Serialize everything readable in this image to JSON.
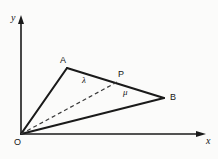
{
  "figure": {
    "background": "#fbfbfa",
    "stroke_color": "#1a1a1a",
    "dashed_color": "#3a3a3a"
  },
  "axes": {
    "x_label": "x",
    "y_label": "y",
    "origin_label": "O",
    "origin": {
      "x": 21,
      "y": 134
    },
    "x_axis_end": {
      "x": 205,
      "y": 134
    },
    "y_axis_end": {
      "x": 21,
      "y": 17
    }
  },
  "points": [
    {
      "name": "A",
      "label": "A",
      "x": 67,
      "y": 68,
      "label_x": 60,
      "label_y": 56
    },
    {
      "name": "B",
      "label": "B",
      "x": 164,
      "y": 98,
      "label_x": 170,
      "label_y": 93
    },
    {
      "name": "P",
      "label": "P",
      "x": 119,
      "y": 81,
      "label_x": 118,
      "label_y": 70
    },
    {
      "name": "O",
      "label": "O",
      "x": 21,
      "y": 134,
      "label_x": 14,
      "label_y": 138
    }
  ],
  "segment_labels": [
    {
      "name": "lambda",
      "label": "λ",
      "x": 82,
      "y": 76
    },
    {
      "name": "mu",
      "label": "μ",
      "x": 123,
      "y": 88
    }
  ],
  "segments": [
    {
      "name": "OA",
      "from": "O",
      "to": "A",
      "style": "solid"
    },
    {
      "name": "AB",
      "from": "A",
      "to": "B",
      "style": "solid"
    },
    {
      "name": "OB",
      "from": "O",
      "to": "B",
      "style": "solid"
    },
    {
      "name": "OP",
      "from": "O",
      "to": "P",
      "style": "dashed"
    }
  ]
}
